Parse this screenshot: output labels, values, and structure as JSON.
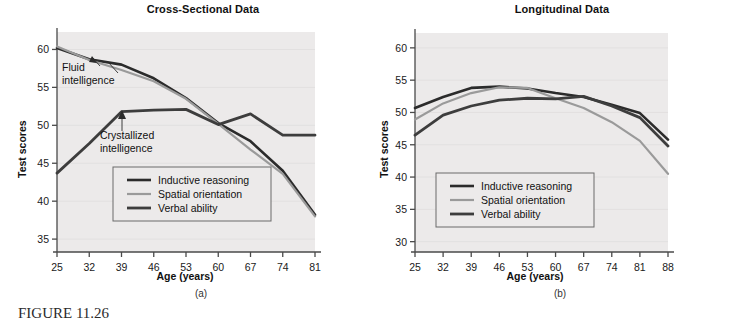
{
  "figure": {
    "caption": "FIGURE 11.26",
    "background": "#ffffff",
    "plot_background": "#eceaea"
  },
  "colors": {
    "inductive_reasoning": "#2b2b2b",
    "spatial_orientation": "#9a9a9a",
    "verbal_ability": "#3d3d3d",
    "axis": "#4a4a4a",
    "gridline": "#e2e0e0",
    "legend_border": "#6a6a6a",
    "text": "#111111"
  },
  "panel_a": {
    "title": "Cross-Sectional Data",
    "letter": "(a)",
    "xlabel": "Age (years)",
    "ylabel": "Test scores",
    "annotations": [
      {
        "name": "fluid-intelligence",
        "line1": "Fluid",
        "line2": "intelligence"
      },
      {
        "name": "crystallized-intelligence",
        "line1": "Crystallized",
        "line2": "intelligence"
      }
    ],
    "legend": [
      {
        "label": "Inductive reasoning",
        "color_key": "inductive_reasoning",
        "width": 2.6
      },
      {
        "label": "Spatial orientation",
        "color_key": "spatial_orientation",
        "width": 2.2
      },
      {
        "label": "Verbal ability",
        "color_key": "verbal_ability",
        "width": 2.8
      }
    ]
  },
  "panel_b": {
    "title": "Longitudinal Data",
    "letter": "(b)",
    "xlabel": "Age (years)",
    "ylabel": "Test scores",
    "legend": [
      {
        "label": "Inductive reasoning",
        "color_key": "inductive_reasoning",
        "width": 2.6
      },
      {
        "label": "Spatial orientation",
        "color_key": "spatial_orientation",
        "width": 2.2
      },
      {
        "label": "Verbal ability",
        "color_key": "verbal_ability",
        "width": 2.8
      }
    ]
  },
  "chart_data": [
    {
      "id": "cross-sectional",
      "type": "line",
      "title": "Cross-Sectional Data",
      "xlabel": "Age (years)",
      "ylabel": "Test scores",
      "categories": [
        25,
        32,
        39,
        46,
        53,
        60,
        67,
        74,
        81
      ],
      "xticklabels": [
        "25",
        "32",
        "39",
        "46",
        "53",
        "60",
        "67",
        "74",
        "81"
      ],
      "yticklabels": [
        "35",
        "40",
        "45",
        "50",
        "55",
        "60"
      ],
      "yticks": [
        35,
        40,
        45,
        50,
        55,
        60
      ],
      "ylim": [
        33.3,
        62.3
      ],
      "grid": true,
      "legend_position": "center",
      "series": [
        {
          "name": "Inductive reasoning",
          "color_key": "inductive_reasoning",
          "values": [
            60.2,
            58.7,
            58.0,
            56.2,
            53.6,
            50.3,
            47.9,
            44.0,
            38.2
          ]
        },
        {
          "name": "Spatial orientation",
          "color_key": "spatial_orientation",
          "values": [
            60.4,
            58.6,
            57.3,
            55.8,
            53.5,
            50.2,
            46.8,
            43.6,
            38.0
          ]
        },
        {
          "name": "Verbal ability",
          "color_key": "verbal_ability",
          "values": [
            43.7,
            47.6,
            51.8,
            52.0,
            52.1,
            50.1,
            51.5,
            48.7,
            48.7
          ]
        }
      ]
    },
    {
      "id": "longitudinal",
      "type": "line",
      "title": "Longitudinal Data",
      "xlabel": "Age (years)",
      "ylabel": "Test scores",
      "categories": [
        25,
        32,
        39,
        46,
        53,
        60,
        67,
        74,
        81,
        88
      ],
      "xticklabels": [
        "25",
        "32",
        "39",
        "46",
        "53",
        "60",
        "67",
        "74",
        "81",
        "88"
      ],
      "yticklabels": [
        "30",
        "35",
        "40",
        "45",
        "50",
        "55",
        "60"
      ],
      "yticks": [
        30,
        35,
        40,
        45,
        50,
        55,
        60
      ],
      "ylim": [
        28.4,
        62.3
      ],
      "grid": true,
      "legend_position": "center",
      "series": [
        {
          "name": "Inductive reasoning",
          "color_key": "inductive_reasoning",
          "values": [
            50.7,
            52.4,
            53.8,
            54.0,
            53.7,
            53.0,
            52.4,
            51.2,
            49.9,
            45.8
          ]
        },
        {
          "name": "Spatial orientation",
          "color_key": "spatial_orientation",
          "values": [
            48.9,
            51.4,
            53.0,
            53.9,
            53.8,
            52.2,
            50.7,
            48.5,
            45.6,
            40.5
          ]
        },
        {
          "name": "Verbal ability",
          "color_key": "verbal_ability",
          "values": [
            46.5,
            49.6,
            51.0,
            51.9,
            52.2,
            52.1,
            52.5,
            51.0,
            49.2,
            44.8
          ]
        }
      ]
    }
  ]
}
